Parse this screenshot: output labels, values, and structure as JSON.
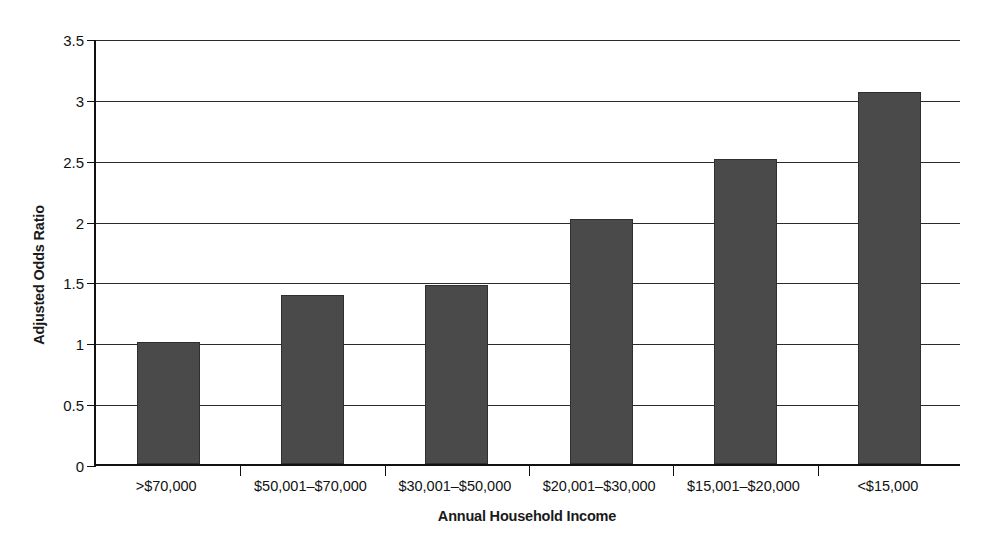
{
  "chart_data": {
    "type": "bar",
    "title": "",
    "subtitle": "",
    "xlabel": "Annual Household Income",
    "ylabel": "Adjusted Odds Ratio",
    "categories": [
      ">$70,000",
      "$50,001–$70,000",
      "$30,001–$50,000",
      "$20,001–$30,000",
      "$15,001–$20,000",
      "<$15,000"
    ],
    "values": [
      1.0,
      1.39,
      1.47,
      2.01,
      2.51,
      3.06
    ],
    "ylim": [
      0,
      3.5
    ],
    "yticks": [
      0,
      0.5,
      1,
      1.5,
      2,
      2.5,
      3,
      3.5
    ],
    "ytick_labels": [
      "0",
      "0.5",
      "1",
      "1.5",
      "2",
      "2.5",
      "3",
      "3.5"
    ],
    "grid": "horizontal",
    "legend": "none",
    "bar_color": "#4a4a4a",
    "bar_edge_color": "#2f2f2f",
    "axis_color": "#111111",
    "gridline_color": "#2b2b2b",
    "background_color": "#ffffff"
  }
}
